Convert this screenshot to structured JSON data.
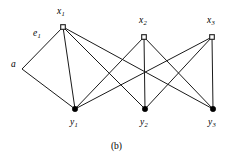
{
  "figure": {
    "caption": "(b)",
    "background_color": "#ffffff",
    "line_color": "#1a1a1a",
    "node_fill_top": "#ffffff",
    "node_fill_bottom": "#000000"
  },
  "chart_data": {
    "type": "diagram",
    "title": "(b)",
    "nodes": [
      {
        "id": "a",
        "label": "a",
        "sub": "",
        "x": 22,
        "y": 69,
        "marker": "none",
        "label_x": 11,
        "label_y": 60
      },
      {
        "id": "x1",
        "label": "x",
        "sub": "1",
        "x": 63,
        "y": 27,
        "marker": "open-square",
        "label_x": 57,
        "label_y": 7
      },
      {
        "id": "x2",
        "label": "x",
        "sub": "2",
        "x": 144,
        "y": 37,
        "marker": "open-square",
        "label_x": 139,
        "label_y": 16
      },
      {
        "id": "x3",
        "label": "x",
        "sub": "3",
        "x": 212,
        "y": 37,
        "marker": "open-square",
        "label_x": 207,
        "label_y": 16
      },
      {
        "id": "y1",
        "label": "y",
        "sub": "1",
        "x": 75,
        "y": 109,
        "marker": "filled-circle",
        "label_x": 70,
        "label_y": 118
      },
      {
        "id": "y2",
        "label": "y",
        "sub": "2",
        "x": 145,
        "y": 109,
        "marker": "filled-circle",
        "label_x": 140,
        "label_y": 118
      },
      {
        "id": "y3",
        "label": "y",
        "sub": "3",
        "x": 213,
        "y": 109,
        "marker": "filled-circle",
        "label_x": 208,
        "label_y": 118
      }
    ],
    "edges": [
      {
        "id": "e1",
        "from": "a",
        "to": "x1",
        "label": "e",
        "sub": "1",
        "label_x": 33,
        "label_y": 29
      },
      {
        "id": "a-y1",
        "from": "a",
        "to": "y1",
        "label": "",
        "sub": "",
        "label_x": 0,
        "label_y": 0
      },
      {
        "id": "x1-y1",
        "from": "x1",
        "to": "y1",
        "label": "",
        "sub": "",
        "label_x": 0,
        "label_y": 0
      },
      {
        "id": "x1-y2",
        "from": "x1",
        "to": "y2",
        "label": "",
        "sub": "",
        "label_x": 0,
        "label_y": 0
      },
      {
        "id": "x1-y3",
        "from": "x1",
        "to": "y3",
        "label": "",
        "sub": "",
        "label_x": 0,
        "label_y": 0
      },
      {
        "id": "x2-y1",
        "from": "x2",
        "to": "y1",
        "label": "",
        "sub": "",
        "label_x": 0,
        "label_y": 0
      },
      {
        "id": "x2-y2",
        "from": "x2",
        "to": "y2",
        "label": "",
        "sub": "",
        "label_x": 0,
        "label_y": 0
      },
      {
        "id": "x2-y3",
        "from": "x2",
        "to": "y3",
        "label": "",
        "sub": "",
        "label_x": 0,
        "label_y": 0
      },
      {
        "id": "x3-y1",
        "from": "x3",
        "to": "y1",
        "label": "",
        "sub": "",
        "label_x": 0,
        "label_y": 0
      },
      {
        "id": "x3-y2",
        "from": "x3",
        "to": "y2",
        "label": "",
        "sub": "",
        "label_x": 0,
        "label_y": 0
      },
      {
        "id": "x3-y3",
        "from": "x3",
        "to": "y3",
        "label": "",
        "sub": "",
        "label_x": 0,
        "label_y": 0
      }
    ]
  }
}
